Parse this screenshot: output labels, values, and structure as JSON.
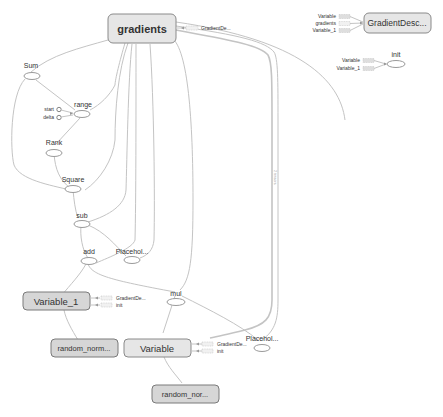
{
  "graph": {
    "main_nodes": {
      "gradients": "gradients",
      "sum": "Sum",
      "range": "range",
      "start": "start",
      "delta": "delta",
      "rank": "Rank",
      "square": "Square",
      "sub": "sub",
      "add": "add",
      "placeholder_1": "Placehol...",
      "mul": "mul",
      "placeholder_2": "Placehol...",
      "variable_1": "Variable_1",
      "variable": "Variable",
      "random_normal_1": "random_norm...",
      "random_normal_2": "random_nor..."
    },
    "stubs": {
      "gradients_out": "GradientDe...",
      "variable_1_grad": "GradientDe...",
      "variable_1_init": "init",
      "variable_grad": "GradientDe...",
      "variable_init": "init"
    },
    "edge_labels": {
      "long_edge": "2 tensors"
    },
    "aux_nodes": {
      "gradient_descent": {
        "label": "GradientDesc...",
        "inputs": [
          "Variable",
          "gradients",
          "Variable_1"
        ]
      },
      "init": {
        "label": "init",
        "inputs": [
          "Variable",
          "Variable_1"
        ]
      }
    }
  }
}
